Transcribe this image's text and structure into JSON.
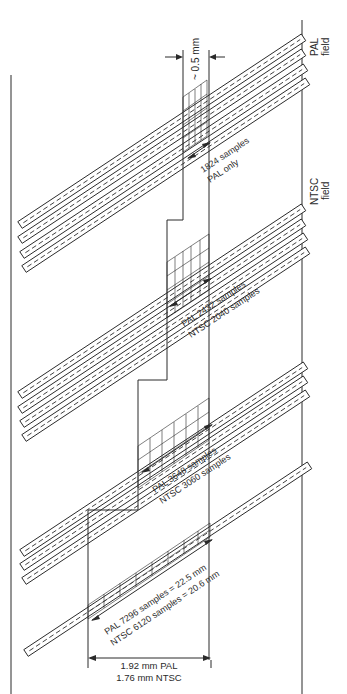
{
  "figure": {
    "labels": {
      "pal_field": [
        "PAL",
        "field"
      ],
      "ntsc_field": [
        "NTSC",
        "field"
      ],
      "track_pitch": "~ 0.5 mm",
      "seg1": [
        "1824 samples",
        "PAL only"
      ],
      "seg2": [
        "PAL 2432 samples",
        "NTSC 2040 samples"
      ],
      "seg3": [
        "PAL 3648 samples",
        "NTSC 3060 samples"
      ],
      "seg4": [
        "PAL 7296 samples = 22.5 mm",
        "NTSC 6120 samples = 20.6 mm"
      ],
      "width": [
        "1.92 mm PAL",
        "1.76 mm NTSC"
      ]
    },
    "track_groups": [
      {
        "name": "group-1",
        "tracks": 4
      },
      {
        "name": "group-2",
        "tracks": 4
      },
      {
        "name": "group-3",
        "tracks": 3
      },
      {
        "name": "group-4",
        "tracks": 1
      }
    ],
    "colors": {
      "ink": "#2a2a2a",
      "paper": "#ffffff"
    }
  }
}
